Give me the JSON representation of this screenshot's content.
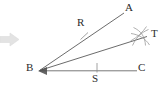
{
  "figure": {
    "type": "geometry-construction",
    "background_color": "#ffffff",
    "stroke_color": "#555555",
    "label_color": "#2b2b2b",
    "arrow_color": "#e0e0e0",
    "labels": [
      {
        "id": "A",
        "text": "A",
        "x": 125,
        "y": 2
      },
      {
        "id": "R",
        "text": "R",
        "x": 77,
        "y": 17
      },
      {
        "id": "T",
        "text": "T",
        "x": 151,
        "y": 28
      },
      {
        "id": "B",
        "text": "B",
        "x": 26,
        "y": 62
      },
      {
        "id": "S",
        "text": "S",
        "x": 92,
        "y": 73
      },
      {
        "id": "C",
        "text": "C",
        "x": 138,
        "y": 62
      }
    ],
    "points": {
      "B": {
        "x": 39,
        "y": 71
      },
      "A": {
        "x": 124,
        "y": 13
      },
      "T": {
        "x": 146,
        "y": 37
      },
      "C": {
        "x": 137,
        "y": 70
      },
      "R": {
        "x": 84,
        "y": 36
      },
      "S": {
        "x": 97,
        "y": 70
      }
    },
    "rays": [
      {
        "name": "ray-BA",
        "from": "B",
        "to": "A"
      },
      {
        "name": "ray-BT",
        "from": "B",
        "to": "T"
      },
      {
        "name": "ray-BC",
        "from": "B",
        "to": "C"
      }
    ],
    "tick_marks": [
      {
        "name": "tick-R",
        "on": "ray-BA",
        "at": {
          "x": 84,
          "y": 36
        }
      },
      {
        "name": "tick-S",
        "on": "ray-BC",
        "at": {
          "x": 97,
          "y": 70
        }
      }
    ],
    "arc_marks": {
      "name": "compass-arcs-at-T",
      "center": {
        "x": 140,
        "y": 38
      },
      "count": 2
    },
    "pointer_arrow": {
      "name": "pointer-arrow",
      "x": 0,
      "y": 33,
      "width": 19,
      "height": 13
    }
  }
}
